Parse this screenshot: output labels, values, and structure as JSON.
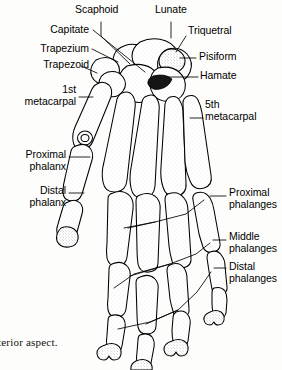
{
  "figure": {
    "caption": "terior aspect.",
    "ink_color": "#000000",
    "background_color": "#fdfdfb",
    "width": 282,
    "height": 370
  },
  "labels": {
    "carpals": [
      {
        "id": "scaphoid",
        "text": "Scaphoid",
        "align": "left",
        "x": 75,
        "y": 6
      },
      {
        "id": "lunate",
        "text": "Lunate",
        "align": "left",
        "x": 155,
        "y": 6
      },
      {
        "id": "capitate",
        "text": "Capitate",
        "align": "right",
        "x": 16,
        "y": 25,
        "w": 73
      },
      {
        "id": "triquetral",
        "text": "Triquetral",
        "align": "left",
        "x": 188,
        "y": 26
      },
      {
        "id": "trapezium",
        "text": "Trapezium",
        "align": "right",
        "x": 10,
        "y": 44,
        "w": 79
      },
      {
        "id": "pisiform",
        "text": "Pisiform",
        "align": "left",
        "x": 198,
        "y": 52
      },
      {
        "id": "trapezoid",
        "text": "Trapezoid",
        "align": "right",
        "x": 11,
        "y": 60,
        "w": 78
      },
      {
        "id": "hamate",
        "text": "Hamate",
        "align": "left",
        "x": 200,
        "y": 71
      }
    ],
    "metacarpals": [
      {
        "id": "first-metacarpal",
        "text": "1st\nmetacarpal",
        "align": "right",
        "x": 6,
        "y": 85,
        "w": 70
      },
      {
        "id": "fifth-metacarpal",
        "text": "5th\nmetacarpal",
        "align": "left",
        "x": 205,
        "y": 100
      }
    ],
    "thumb_phalanges": [
      {
        "id": "proximal-phalanx",
        "text": "Proximal\nphalanx",
        "align": "right",
        "x": 4,
        "y": 150,
        "w": 62
      },
      {
        "id": "distal-phalanx",
        "text": "Distal\nphalanx",
        "align": "right",
        "x": 4,
        "y": 186,
        "w": 62
      }
    ],
    "finger_phalanges": [
      {
        "id": "proximal-phalanges",
        "text": "Proximal\nphalanges",
        "align": "left",
        "x": 228,
        "y": 188
      },
      {
        "id": "middle-phalanges",
        "text": "Middle\nphalanges",
        "align": "left",
        "x": 228,
        "y": 232
      },
      {
        "id": "distal-phalanges",
        "text": "Distal\nphalanges",
        "align": "left",
        "x": 228,
        "y": 262
      }
    ]
  },
  "leader_lines": [
    {
      "id": "scaphoid-leader",
      "points": "101,22 101,36 130,64"
    },
    {
      "id": "lunate-leader",
      "points": "171,22 171,38"
    },
    {
      "id": "capitate-leader",
      "points": "93,30 145,72"
    },
    {
      "id": "triquetral-leader",
      "points": "186,36 176,52"
    },
    {
      "id": "trapezium-leader",
      "points": "92,49 118,62"
    },
    {
      "id": "pisiform-leader",
      "points": "196,58 178,58"
    },
    {
      "id": "trapezoid-leader",
      "points": "81,66 96,72"
    },
    {
      "id": "hamate-leader",
      "points": "198,77 168,77"
    },
    {
      "id": "first-metacarpal-leader",
      "points": "79,97 92,97"
    },
    {
      "id": "fifth-metacarpal-leader",
      "points": "203,118 190,118"
    },
    {
      "id": "proximal-phalanx-leader",
      "points": "69,157 90,157"
    },
    {
      "id": "distal-phalanx-leader",
      "points": "69,193 86,193"
    },
    {
      "id": "proximal-phalanges-leader",
      "points": "226,196 209,196"
    },
    {
      "id": "proximal-phalanges-fan",
      "points": "204,200 190,216 160,222 128,228"
    },
    {
      "id": "middle-phalanges-leader",
      "points": "226,240 212,240"
    },
    {
      "id": "middle-phalanges-fan",
      "points": "209,243 194,252 168,262 132,272 113,286"
    },
    {
      "id": "distal-phalanges-leader",
      "points": "226,268 213,268"
    },
    {
      "id": "distal-phalanges-fan",
      "points": "210,272 196,290 176,308 150,320 116,328"
    }
  ]
}
